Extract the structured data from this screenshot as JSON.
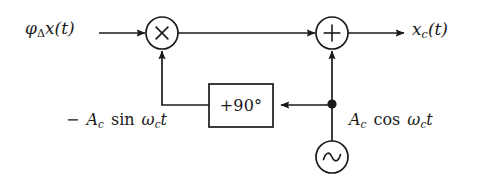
{
  "figure": {
    "background_color": "#ffffff",
    "line_color": "#1a1a1a",
    "text_color": "#1a1a1a",
    "width": 479,
    "height": 182
  },
  "labels": {
    "input_signal": {
      "text": "φΔx(t)",
      "base": "φ",
      "subscript": "Δ",
      "rest": "x(t)"
    },
    "output_signal": {
      "text": "xc(t)",
      "base": "x",
      "subscript": "c",
      "rest": "(t)"
    },
    "lower_carrier": {
      "text": "−Ac sin ωct",
      "sign": "−",
      "amplitude": "A",
      "amplitude_subscript": "c",
      "function": "sin",
      "omega": "ω",
      "omega_subscript": "c",
      "time": "t"
    },
    "upper_carrier": {
      "text": "Ac cos ωct",
      "amplitude": "A",
      "amplitude_subscript": "c",
      "function": "cos",
      "omega": "ω",
      "omega_subscript": "c",
      "time": "t"
    },
    "phase_shifter": {
      "text": "+90°"
    }
  },
  "nodes": {
    "multiplier": {
      "symbol": "×",
      "name": "multiplier",
      "cx": 162,
      "cy": 33,
      "r": 16
    },
    "summer": {
      "symbol": "+",
      "name": "summing-junction",
      "cx": 332,
      "cy": 33,
      "r": 16
    },
    "oscillator": {
      "symbol": "∼",
      "name": "oscillator",
      "cx": 332,
      "cy": 157,
      "r": 16
    },
    "phase_shift_block": {
      "label": "+90°",
      "x": 209,
      "y": 84,
      "w": 64,
      "h": 43
    },
    "junction": {
      "name": "wire-junction-dot",
      "cx": 332,
      "cy": 104,
      "r": 4.5
    }
  }
}
